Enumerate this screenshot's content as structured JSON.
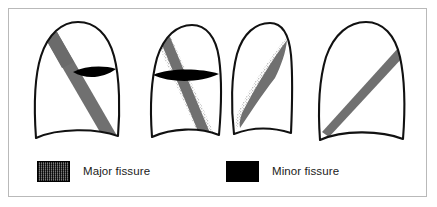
{
  "figure": {
    "border_color": "#b9b9b9",
    "background_color": "#ffffff"
  },
  "colors": {
    "major_fissure_gray": "#707070",
    "minor_fissure_black": "#000000",
    "outline_black": "#111111",
    "stipple_gray": "#8a8a8a",
    "frame_gray": "#b9b9b9"
  },
  "legend": {
    "items": [
      {
        "key": "major",
        "label": "Major fissure",
        "swatch_style": "hatched-dark-gray",
        "swatch_color": "#4a4a4a"
      },
      {
        "key": "minor",
        "label": "Minor fissure",
        "swatch_style": "solid-black",
        "swatch_color": "#000000"
      }
    ]
  },
  "panels": [
    {
      "index": 1,
      "name": "right-lung-frontal",
      "view": "frontal",
      "side": "right",
      "has_major_fissure": true,
      "has_minor_fissure": true,
      "stippled": false
    },
    {
      "index": 2,
      "name": "right-lung-frontal-stippled",
      "view": "frontal",
      "side": "right",
      "has_major_fissure": true,
      "has_minor_fissure": true,
      "stippled": true
    },
    {
      "index": 3,
      "name": "right-lung-lateral",
      "view": "lateral",
      "side": "right",
      "has_major_fissure": true,
      "has_minor_fissure": false,
      "stippled": true
    },
    {
      "index": 4,
      "name": "left-lung-frontal",
      "view": "frontal",
      "side": "left",
      "has_major_fissure": true,
      "has_minor_fissure": false,
      "stippled": false
    }
  ]
}
